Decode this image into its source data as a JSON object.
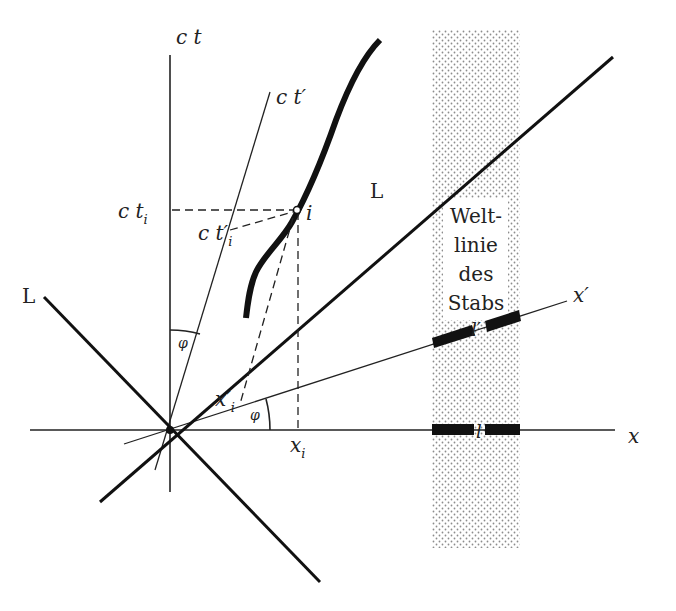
{
  "diagram": {
    "type": "minkowski-spacetime-diagram",
    "axes": {
      "ct": "c t",
      "ct_prime": "c t′",
      "x": "x",
      "x_prime": "x′"
    },
    "light_cone_labels": {
      "left": "L",
      "right": "L"
    },
    "angle_label_upper": "φ",
    "angle_label_lower": "φ",
    "event": {
      "name": "i",
      "ct_i": "c t",
      "ct_i_sub": "i",
      "ct_prime_i": "c t′",
      "ct_prime_i_sub": "i",
      "x_i": "x",
      "x_i_sub": "i",
      "x_prime_i": "x′",
      "x_prime_i_sub": "i"
    },
    "rod_worldline_label": [
      "Welt-",
      "linie",
      "des",
      "Stabs"
    ],
    "rod_length_primed": "l′",
    "rod_length": "l",
    "colors": {
      "ink": "#111111",
      "stipple": "#9a9a9a",
      "background": "#ffffff"
    }
  }
}
